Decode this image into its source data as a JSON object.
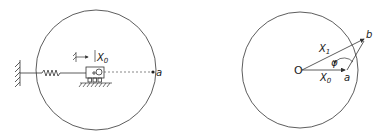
{
  "figure": {
    "left_panel": {
      "labels": {
        "displacement": "X",
        "displacement_sub": "0",
        "point": "a"
      }
    },
    "right_panel": {
      "labels": {
        "origin": "O",
        "vector_x1": "X",
        "vector_x1_sub": "1",
        "vector_x0": "X",
        "vector_x0_sub": "0",
        "angle": "φ",
        "point_a": "a",
        "point_b": "b"
      }
    },
    "colors": {
      "line": "#333333",
      "background": "#ffffff"
    }
  }
}
